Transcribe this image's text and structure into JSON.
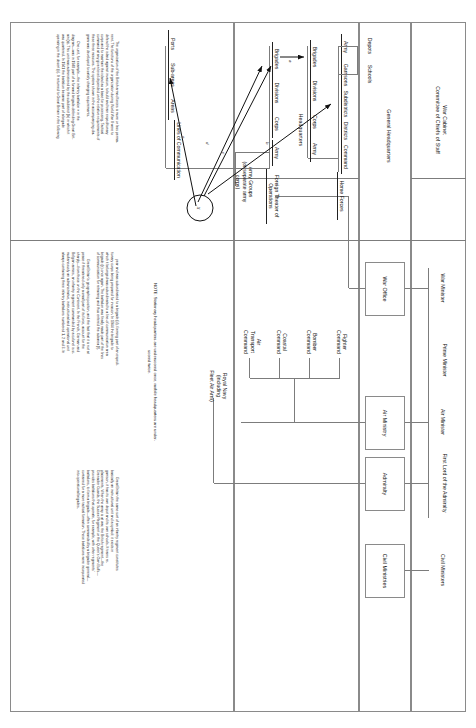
{
  "diagram": {
    "title_hidden": "",
    "levels": {
      "war_cabinet": "War Cabinet\nCommittee of Chiefs of Staff",
      "general_hq": "General Headquarters",
      "headquarters": "Headquarters"
    },
    "government": {
      "prime_minister": "Prime Minister",
      "ministers": [
        "War Minister",
        "Air Minister",
        "First Lord of the Admiralty",
        "Civil Ministers"
      ]
    },
    "ministries": [
      "War Office",
      "Air Ministry",
      "Admiralty",
      "Civil Ministries"
    ],
    "war_office_branches": [
      {
        "name": "Home Forces"
      },
      {
        "name": "Foreign Theater of\nOperations"
      }
    ],
    "home_forces_chain": [
      "Command",
      "Districts",
      "Subdistricts",
      "Garrisons",
      "Army"
    ],
    "home_support": [
      "Schools",
      "Depots"
    ],
    "home_field_chain": [
      "Army",
      "Corps",
      "Divisions",
      "Brigades"
    ],
    "foreign_chain": [
      "Army",
      "Corps",
      "Divisions",
      "Brigades"
    ],
    "army_groups": "Army Groups\n(or separate army\ncorps)",
    "loc_chain": [
      "Lines of Communication",
      "Areas",
      "Sub-areas",
      "Ports"
    ],
    "air_ministry_commands": [
      "Fighter\nCommand",
      "Bomber\nCommand",
      "Coastal\nCommand",
      "Air\nTransport\nCommand"
    ],
    "admiralty_branch": "Royal Navy\n(including\nFleet Air Arm)",
    "note": "NOTE: Stationary headquarters are underscored once, mobile headquarters are under-\nscored twice.",
    "arrow_marks": [
      "a",
      "b",
      "c",
      "d",
      "e"
    ],
    "text_columns": [
      {
        "id": "col1",
        "paragraphs": [
          "The organization of the British armed forces is more or less perma-\nnent. The functions of the organization during World War II were to\ndefend the island against invasion, to build and train expeditionary\ncorps and to maintain the island as a base for processing. Tactical\ncommand at any given level depended on the relative requirements of\nthese three missions. The system shown in the accompanying dia-\ngram was developed to satisfy changing requirements.",
          "One unit, for example—the infantry battalion × in the\ndiagram—was in 1940 part of a forward brigade defending Great Brit-\nain (a). This unit was administered by the subdistrict (b) in which it\nwas quartered. In 1941 the battalion became part of a brigade\noperating in the desert (c). It returned to Great Britain in the following"
        ]
      },
      {
        "id": "col2",
        "paragraphs": [
          "year and was subordinated to a brigade (d), forming part of an expedi-\ntionary corps being prepared for invasion. In 1944 the brigade to\nwhich it belonged was subordinated to a line-of-communication area\nbrigade (e) once again. The battalion was finally made part of the lines\nof communication for retraining and thus entered the subarea (f).",
          "Great Britain's geographic position, and the fact that it is not at\npeace if threatened only a small part of its force, account for the\nsharply—from those on the Continent. In the French, German and\nBelgian armies, an infantry regiment commanded by a colonel is si-\nmultaneously an administrative, instructional and operational unit\nalways containing three infantry battalions numbered 1, 2 and 3. In"
        ]
      },
      {
        "id": "col3",
        "paragraphs": [
          "Great Britain the same sort of an infantry regiment constitutes\nbasically an instructional unit and a symbol: it exists in\ngarrison, it has its own depot and its own schools. It trains re-\nplacements. When the army is at war, the British regiment—the\nGrenadier Guards, the Sussex Regiment or the Queen's Own Buffs—\nprovides battalions that operate, for example, with other regiments'\nbattalions, to form a brigade—often commanded by a brigadier general—\ncontained for a more tactical formation. These battalions were incorporated\ninto operational brigades."
        ]
      }
    ]
  }
}
